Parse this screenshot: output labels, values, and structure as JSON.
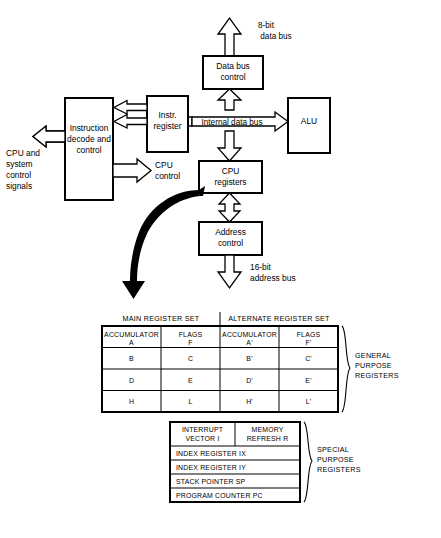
{
  "diagram": {
    "blocks": {
      "data_bus_control": {
        "line1": "Data bus",
        "line2": "control"
      },
      "instruction_decode": {
        "line1": "Instruction",
        "line2": "decode and",
        "line3": "control"
      },
      "instr_register": {
        "line1": "Instr.",
        "line2": "register"
      },
      "alu": {
        "line1": "ALU"
      },
      "cpu_registers": {
        "line1": "CPU",
        "line2": "registers"
      },
      "address_control": {
        "line1": "Address",
        "line2": "control"
      }
    },
    "labels": {
      "data_bus": {
        "line1": "8-bit",
        "line2": "data bus"
      },
      "address_bus": {
        "line1": "16-bit",
        "line2": "address bus"
      },
      "internal_data_bus": "Internal data bus",
      "cpu_control": {
        "line1": "CPU",
        "line2": "control"
      },
      "cpu_system_control": {
        "line1": "CPU and",
        "line2": "system",
        "line3": "control",
        "line4": "signals"
      }
    }
  },
  "register_tables": {
    "main_table": {
      "headers": [
        "MAIN REGISTER SET",
        "ALTERNATE REGISTER SET"
      ],
      "rows": [
        [
          {
            "line1": "ACCUMULATOR",
            "line2": "A"
          },
          {
            "line1": "FLAGS",
            "line2": "F"
          },
          {
            "line1": "ACCUMULATOR",
            "line2": "A'"
          },
          {
            "line1": "FLAGS",
            "line2": "F'"
          }
        ],
        [
          {
            "line1": "B"
          },
          {
            "line1": "C"
          },
          {
            "line1": "B'"
          },
          {
            "line1": "C'"
          }
        ],
        [
          {
            "line1": "D"
          },
          {
            "line1": "E"
          },
          {
            "line1": "D'"
          },
          {
            "line1": "E'"
          }
        ],
        [
          {
            "line1": "H"
          },
          {
            "line1": "L"
          },
          {
            "line1": "H'"
          },
          {
            "line1": "L'"
          }
        ]
      ],
      "side_label": {
        "line1": "GENERAL",
        "line2": "PURPOSE",
        "line3": "REGISTERS"
      }
    },
    "special_table": {
      "rows": [
        {
          "type": "split",
          "left": {
            "line1": "INTERRUPT",
            "line2": "VECTOR  I"
          },
          "right": {
            "line1": "MEMORY",
            "line2": "REFRESH  R"
          }
        },
        {
          "type": "full",
          "text": "INDEX REGISTER  IX"
        },
        {
          "type": "full",
          "text": "INDEX REGISTER  IY"
        },
        {
          "type": "full",
          "text": "STACK POINTER  SP"
        },
        {
          "type": "full",
          "text": "PROGRAM COUNTER  PC"
        }
      ],
      "side_label": {
        "line1": "SPECIAL",
        "line2": "PURPOSE",
        "line3": "REGISTERS"
      }
    }
  },
  "colors": {
    "stroke": "#000000",
    "fill": "#ffffff",
    "arrow_fill": "#ffffff",
    "curve_fill": "#000000"
  }
}
